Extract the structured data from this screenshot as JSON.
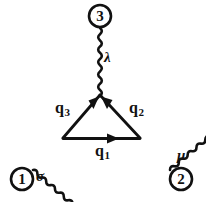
{
  "figure": {
    "type": "feynman-diagram",
    "name": "triangle-diagram",
    "background_color": "#ffffff",
    "ink_color": "#111111"
  },
  "external_nodes": [
    {
      "id": "node-3",
      "label": "3",
      "position": "top",
      "cx": 100,
      "cy": 16,
      "r": 11
    },
    {
      "id": "node-1",
      "label": "1",
      "position": "bottom-left",
      "cx": 22,
      "cy": 179,
      "r": 11
    },
    {
      "id": "node-2",
      "label": "2",
      "position": "bottom-right",
      "cx": 181,
      "cy": 179,
      "r": 11
    }
  ],
  "boson_lines": [
    {
      "id": "photon-lambda",
      "label": "λ",
      "from": "node-3",
      "to": "vertex-apex",
      "label_x": 104,
      "label_y": 50
    },
    {
      "id": "photon-sigma",
      "label": "σ",
      "from": "node-1",
      "to": "vertex-bottom-left",
      "label_x": 36,
      "label_y": 169
    },
    {
      "id": "photon-mu",
      "label": "μ",
      "from": "node-2",
      "to": "vertex-bottom-right",
      "label_x": 177,
      "label_y": 148
    }
  ],
  "fermion_lines": [
    {
      "id": "q3",
      "label": "q",
      "subscript": "3",
      "direction": "toward-apex",
      "label_x": 55,
      "label_y": 100
    },
    {
      "id": "q2",
      "label": "q",
      "subscript": "2",
      "direction": "toward-apex",
      "label_x": 129,
      "label_y": 100
    },
    {
      "id": "q1",
      "label": "q",
      "subscript": "1",
      "direction": "rightward",
      "label_x": 95,
      "label_y": 143
    }
  ],
  "vertices": [
    {
      "id": "vertex-apex",
      "x": 100,
      "y": 95
    },
    {
      "id": "vertex-bottom-left",
      "x": 63,
      "y": 138
    },
    {
      "id": "vertex-bottom-right",
      "x": 140,
      "y": 138
    }
  ]
}
